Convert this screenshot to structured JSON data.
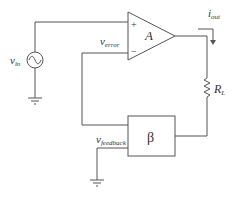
{
  "diagram": {
    "type": "circuit",
    "title": "",
    "components": {
      "source": {
        "label": "v",
        "subscript": "in",
        "symbol": "ac-voltage-source"
      },
      "amplifier": {
        "label": "A",
        "plus": "+",
        "minus": "−",
        "symbol": "op-amp"
      },
      "load": {
        "label": "R",
        "subscript": "L",
        "symbol": "resistor"
      },
      "feedback": {
        "label": "β",
        "symbol": "block"
      },
      "ground_source": {
        "symbol": "ground"
      },
      "ground_feedback": {
        "symbol": "ground"
      }
    },
    "labels": {
      "v_error": {
        "main": "v",
        "sub": "error"
      },
      "i_out": {
        "main": "i",
        "sub": "out"
      },
      "v_feedback": {
        "main": "v",
        "sub": "feedback"
      }
    }
  }
}
